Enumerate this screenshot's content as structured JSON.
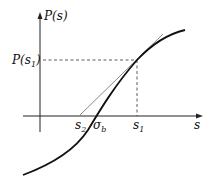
{
  "figure": {
    "y_axis_label": "P(s)",
    "x_axis_label": "s",
    "p_s1_label": {
      "main": "P(s",
      "sub": "1",
      "close": ")"
    },
    "s2_label": {
      "main": "s",
      "sub": "2"
    },
    "sigma_b_label": {
      "main": "σ",
      "sub": "b"
    },
    "s1_label": {
      "main": "s",
      "sub": "1"
    },
    "colors": {
      "curve": "#111111",
      "axis": "#222222",
      "tangent": "#555555",
      "dashed": "#333333"
    }
  }
}
